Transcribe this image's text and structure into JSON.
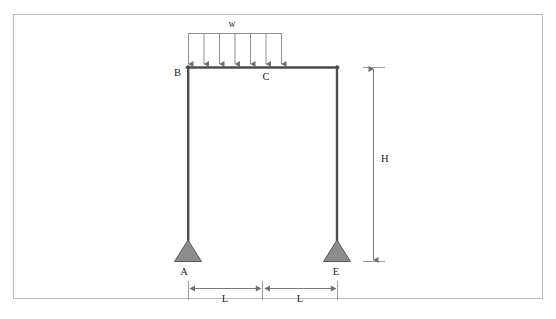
{
  "figure": {
    "kind": "structural-frame-diagram",
    "background_color": "#ffffff",
    "border_color": "#b9b9bd",
    "member_color": "#4d4d4d",
    "support_fill": "#8c8c8c",
    "support_stroke": "#5a5a5a",
    "dimension_color": "#7a7a80",
    "load_color": "#8e8e94",
    "text_color": "#231f20"
  },
  "labels": {
    "node_a": "A",
    "node_b": "B",
    "node_c": "C",
    "node_e": "E",
    "load": "w",
    "height": "H",
    "span_left": "L",
    "span_right": "L"
  },
  "load": {
    "name": "uniformly-distributed-load",
    "symbol": "w",
    "arrow_count": 7,
    "direction": "downward"
  },
  "supports": [
    {
      "node": "A",
      "type": "pin"
    },
    {
      "node": "E",
      "type": "pin"
    }
  ],
  "dimensions": [
    {
      "name": "height",
      "label": "H",
      "orientation": "vertical"
    },
    {
      "name": "span-left",
      "label": "L",
      "orientation": "horizontal"
    },
    {
      "name": "span-right",
      "label": "L",
      "orientation": "horizontal"
    }
  ],
  "artifact": {
    "top_cut_text": "· · · ·  ·  ·"
  }
}
